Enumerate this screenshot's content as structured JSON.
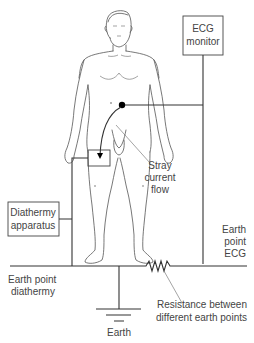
{
  "diagram": {
    "ecg_monitor": {
      "line1": "ECG",
      "line2": "monitor"
    },
    "diathermy": {
      "line1": "Diathermy",
      "line2": "apparatus"
    },
    "stray": {
      "line1": "Stray",
      "line2": "current",
      "line3": "flow"
    },
    "earth_ecg": {
      "line1": "Earth",
      "line2": "point",
      "line3": "ECG"
    },
    "earth_diathermy": {
      "line1": "Earth point",
      "line2": "diathermy"
    },
    "resistance": {
      "line1": "Resistance between",
      "line2": "different earth points"
    },
    "earth": {
      "label": "Earth"
    }
  },
  "colors": {
    "line": "#333333",
    "text": "#444444",
    "background": "#ffffff"
  }
}
